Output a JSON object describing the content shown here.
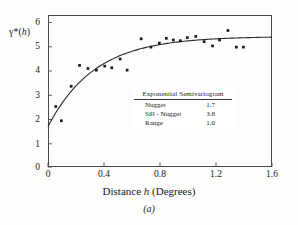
{
  "figure": {
    "panel_caption": "(a)"
  },
  "axes": {
    "ylabel_prefix": "γ",
    "ylabel_star": "*(",
    "ylabel_var": "h",
    "ylabel_suffix": ")",
    "xlabel_prefix": "Distance ",
    "xlabel_var": "h",
    "xlabel_suffix": " (Degrees)",
    "yticks": [
      "0",
      "1",
      "2",
      "3",
      "4",
      "5",
      "6"
    ],
    "xticks": [
      "0",
      "0.4",
      "0.8",
      "1.2",
      "1.6"
    ]
  },
  "legend": {
    "title": "Exponential Semivariogram",
    "rows": [
      {
        "label": "Nugget",
        "value": "1.7"
      },
      {
        "label": "Sill - Nugget",
        "value": "3.8"
      },
      {
        "label": "Range",
        "value": "1.0"
      }
    ]
  },
  "colors": {
    "axis": "#4a4a4a",
    "marker": "#1a1a1a",
    "curve": "#2a2a2a",
    "background": "#fdfdfc"
  },
  "chart_data": {
    "type": "scatter",
    "title": "",
    "xlabel": "Distance h (Degrees)",
    "ylabel": "γ*(h)",
    "xlim": [
      0,
      1.6
    ],
    "ylim": [
      0,
      6.4
    ],
    "xticks": [
      0,
      0.4,
      0.8,
      1.2,
      1.6
    ],
    "yticks": [
      0,
      1,
      2,
      3,
      4,
      5,
      6
    ],
    "grid": false,
    "legend_position": "inset-center",
    "series": [
      {
        "name": "Empirical semivariogram",
        "type": "scatter",
        "marker": "square",
        "points": [
          {
            "x": 0.055,
            "y": 2.55
          },
          {
            "x": 0.095,
            "y": 1.95
          },
          {
            "x": 0.165,
            "y": 3.4
          },
          {
            "x": 0.225,
            "y": 4.28
          },
          {
            "x": 0.285,
            "y": 4.15
          },
          {
            "x": 0.345,
            "y": 4.08
          },
          {
            "x": 0.405,
            "y": 4.25
          },
          {
            "x": 0.455,
            "y": 4.18
          },
          {
            "x": 0.515,
            "y": 4.55
          },
          {
            "x": 0.565,
            "y": 4.08
          },
          {
            "x": 0.665,
            "y": 5.4
          },
          {
            "x": 0.735,
            "y": 5.05
          },
          {
            "x": 0.795,
            "y": 5.22
          },
          {
            "x": 0.845,
            "y": 5.42
          },
          {
            "x": 0.895,
            "y": 5.35
          },
          {
            "x": 0.945,
            "y": 5.32
          },
          {
            "x": 0.995,
            "y": 5.45
          },
          {
            "x": 1.055,
            "y": 5.5
          },
          {
            "x": 1.115,
            "y": 5.28
          },
          {
            "x": 1.175,
            "y": 5.1
          },
          {
            "x": 1.225,
            "y": 5.35
          },
          {
            "x": 1.285,
            "y": 5.75
          },
          {
            "x": 1.345,
            "y": 5.05
          },
          {
            "x": 1.395,
            "y": 5.05
          }
        ]
      },
      {
        "name": "Fitted exponential model",
        "type": "line",
        "model": "gamma(h) = nugget + (sill - nugget) * (1 - exp(-3h/range))",
        "nugget": 1.7,
        "sill_minus_nugget": 3.8,
        "range": 1.0
      }
    ]
  }
}
